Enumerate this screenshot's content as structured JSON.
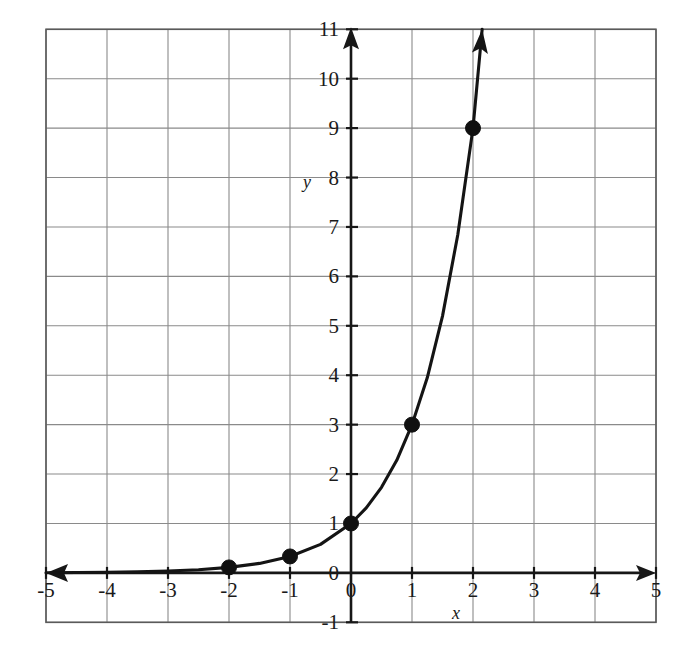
{
  "chart_data": {
    "type": "line",
    "title": "",
    "subtitle": "",
    "xlabel": "x",
    "ylabel": "y",
    "function_label": "y = 3^x",
    "xlim": [
      -5,
      5
    ],
    "ylim": [
      -1,
      11
    ],
    "grid": true,
    "grid_step_x": 1,
    "grid_step_y": 1,
    "legend": "none",
    "x_ticks": [
      "-5",
      "-4",
      "-3",
      "-2",
      "-1",
      "0",
      "1",
      "2",
      "3",
      "4",
      "5"
    ],
    "x_tick_values": [
      -5,
      -4,
      -3,
      -2,
      -1,
      0,
      1,
      2,
      3,
      4,
      5
    ],
    "y_ticks": [
      "-1",
      "0",
      "1",
      "2",
      "3",
      "4",
      "5",
      "6",
      "7",
      "8",
      "9",
      "10",
      "11"
    ],
    "y_tick_values": [
      -1,
      0,
      1,
      2,
      3,
      4,
      5,
      6,
      7,
      8,
      9,
      10,
      11
    ],
    "series": [
      {
        "name": "y = 3^x",
        "curve_x": [
          -5,
          -4.5,
          -4,
          -3.5,
          -3,
          -2.5,
          -2,
          -1.5,
          -1,
          -0.5,
          0,
          0.25,
          0.5,
          0.75,
          1,
          1.25,
          1.5,
          1.75,
          2,
          2.15
        ],
        "curve_y": [
          0.004,
          0.007,
          0.012,
          0.021,
          0.037,
          0.064,
          0.111,
          0.192,
          0.333,
          0.577,
          1,
          1.316,
          1.732,
          2.279,
          3,
          3.948,
          5.196,
          6.838,
          9,
          11.0
        ]
      }
    ],
    "marked_points": [
      {
        "label": "(-2, 1/9)",
        "x": -2,
        "y": 0.111
      },
      {
        "label": "(-1, 1/3)",
        "x": -1,
        "y": 0.333
      },
      {
        "label": "(0, 1)",
        "x": 0,
        "y": 1
      },
      {
        "label": "(1, 3)",
        "x": 1,
        "y": 3
      },
      {
        "label": "(2, 9)",
        "x": 2,
        "y": 9
      }
    ],
    "arrows": {
      "x_axis_left": true,
      "x_axis_right": true,
      "y_axis_up": true,
      "curve_up_right": true
    },
    "colors": {
      "curve": "#141414",
      "axis": "#171717",
      "grid": "#8a8a8a",
      "point": "#101010",
      "background": "#ffffff"
    }
  }
}
